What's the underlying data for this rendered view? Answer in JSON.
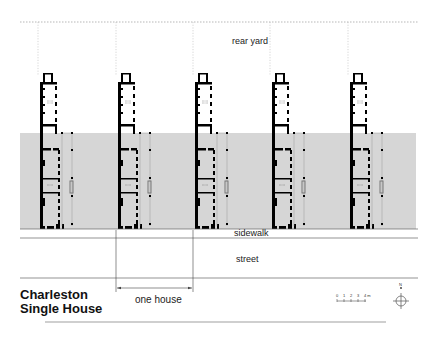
{
  "diagram": {
    "title_line1": "Charleston",
    "title_line2": "Single House",
    "labels": {
      "rear_yard": "rear yard",
      "sidewalk": "sidewalk",
      "street": "street",
      "one_house": "one house"
    },
    "scale_bar": {
      "ticks": [
        "0",
        "1",
        "2",
        "3",
        "4 m"
      ]
    },
    "north_arrow": {
      "label": "N"
    },
    "house_count": 5,
    "colors": {
      "lot_band": "#d6d6d6",
      "walls": "#000000",
      "lines": "#555555",
      "dotted": "#999999"
    }
  }
}
